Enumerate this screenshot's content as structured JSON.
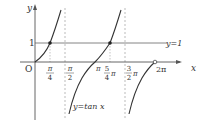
{
  "axes": {
    "x_label": "x",
    "y_label": "y",
    "origin_label": "O"
  },
  "y_ticks": [
    {
      "label": "1",
      "value": 1
    }
  ],
  "x_ticks": [
    {
      "num": "π",
      "den": "4",
      "value": "π/4"
    },
    {
      "num": "π",
      "den": "2",
      "value": "π/2"
    },
    {
      "label": "π",
      "value": "π"
    },
    {
      "num": "5",
      "den": "4",
      "suffix": "π",
      "value": "5π/4"
    },
    {
      "num": "3",
      "den": "2",
      "suffix": "π",
      "value": "3π/2"
    },
    {
      "label": "2π",
      "value": "2π"
    }
  ],
  "lines": {
    "y1_label": "y=1",
    "curve_label": "y=tan x"
  },
  "colors": {
    "curve": "#333333",
    "axis": "#555555",
    "dashed": "#999999"
  }
}
